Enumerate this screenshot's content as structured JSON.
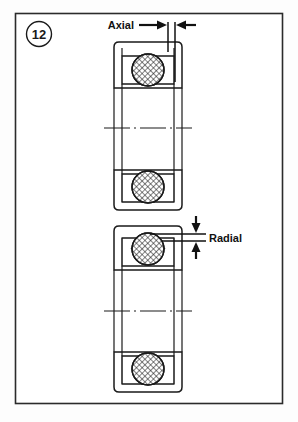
{
  "figure": {
    "badge_number": "12",
    "frame": {
      "x": 15,
      "y": 13,
      "width": 268,
      "height": 391
    },
    "background_color": "#ffffff",
    "line_color": "#1a1a1a"
  },
  "annotations": {
    "axial": {
      "label": "Axial",
      "orientation": "horizontal",
      "description": "Axial clearance measured between two vertical reference lines at the top of the upper bearing"
    },
    "radial": {
      "label": "Radial",
      "orientation": "vertical",
      "description": "Radial clearance measured between two horizontal reference lines at the top of the lower bearing"
    }
  },
  "bearings": [
    {
      "id": "upper-bearing",
      "name": "Ball bearing cross-section showing axial clearance",
      "dimension": "Axial",
      "balls": 2,
      "ball_fill": "hatched",
      "has_centerline": true
    },
    {
      "id": "lower-bearing",
      "name": "Ball bearing cross-section showing radial clearance",
      "dimension": "Radial",
      "balls": 2,
      "ball_fill": "hatched",
      "has_centerline": true
    }
  ]
}
